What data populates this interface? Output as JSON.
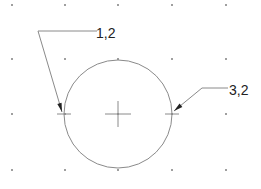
{
  "diagram": {
    "type": "cad-grid-circle-with-leaders",
    "colors": {
      "background": "#ffffff",
      "grid_dot": "#555555",
      "geometry": "#8a8a8a",
      "leader": "#8a8a8a",
      "arrow": "#222222",
      "text": "#222222"
    },
    "grid": {
      "x": [
        12,
        65,
        118,
        172,
        226
      ],
      "y": [
        5,
        59,
        114,
        170
      ]
    },
    "circle": {
      "cx": 118,
      "cy": 114,
      "r": 54
    },
    "center_mark": {
      "x": 118,
      "y": 114,
      "size": 13
    },
    "quadrant_marks": [
      {
        "name": "left",
        "x": 64,
        "y": 114
      },
      {
        "name": "right",
        "x": 172,
        "y": 114
      }
    ],
    "leaders": [
      {
        "label": "1,2",
        "points": "62,112 38,31 97,31",
        "text_x": 96,
        "text_y": 38
      },
      {
        "label": "3,2",
        "points": "174,111 202,88 228,88",
        "text_x": 229,
        "text_y": 95
      }
    ]
  }
}
